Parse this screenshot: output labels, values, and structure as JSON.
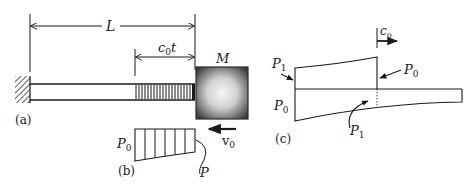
{
  "figure": {
    "panel_a": {
      "caption": "(a)",
      "length_label": "L",
      "wave_front_label": "c",
      "wave_front_sub": "0",
      "wave_front_suffix": "t",
      "mass_label": "M",
      "velocity_label": "v",
      "velocity_sub": "0"
    },
    "panel_b": {
      "caption": "(b)",
      "p0_label": "P",
      "p0_sub": "0",
      "p_label": "P"
    },
    "panel_c": {
      "caption": "(c)",
      "speed_label": "c",
      "speed_sub": "0",
      "p1_top_label": "P",
      "p1_top_sub": "1",
      "p0_right_label": "P",
      "p0_right_sub": "0",
      "p0_left_label": "P",
      "p0_left_sub": "0",
      "p1_bottom_label": "P",
      "p1_bottom_sub": "1"
    },
    "colors": {
      "ink": "#1a1a1a",
      "mass_edge": "#3a3a3a",
      "mass_center": "#f4f4f4"
    }
  }
}
